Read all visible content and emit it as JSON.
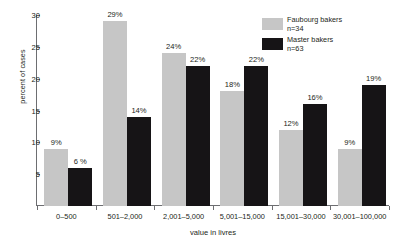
{
  "chart_data": {
    "type": "bar",
    "title": "",
    "xlabel": "value in livres",
    "ylabel": "percent of cases",
    "ylim": [
      0,
      30
    ],
    "yticks": [
      0,
      5,
      10,
      15,
      20,
      25,
      30
    ],
    "ytick_labels": [
      "",
      "5",
      "10",
      "15",
      "20",
      "25",
      "30"
    ],
    "grid": false,
    "legend_position": "top-right",
    "categories": [
      "0–500",
      "501–2,000",
      "2,001–5,000",
      "5,001–15,000",
      "15,001–30,000",
      "30,001–100,000"
    ],
    "series": [
      {
        "name": "Faubourg bakers",
        "n_label": "n=34",
        "color": "#c6c6c6",
        "values": [
          9,
          29,
          24,
          18,
          12,
          9
        ],
        "value_labels": [
          "9%",
          "29%",
          "24%",
          "18%",
          "12%",
          "9%"
        ]
      },
      {
        "name": "Master bakers",
        "n_label": "n=63",
        "color": "#161416",
        "values": [
          6,
          14,
          22,
          22,
          16,
          19
        ],
        "value_labels": [
          "6 %",
          "14%",
          "22%",
          "22%",
          "16%",
          "19%"
        ]
      }
    ]
  },
  "legend": {
    "items": [
      {
        "label": "Faubourg bakers",
        "sub": "n=34"
      },
      {
        "label": "Master bakers",
        "sub": "n=63"
      }
    ]
  },
  "axes": {
    "y_title": "percent of cases",
    "x_title": "value in livres"
  }
}
